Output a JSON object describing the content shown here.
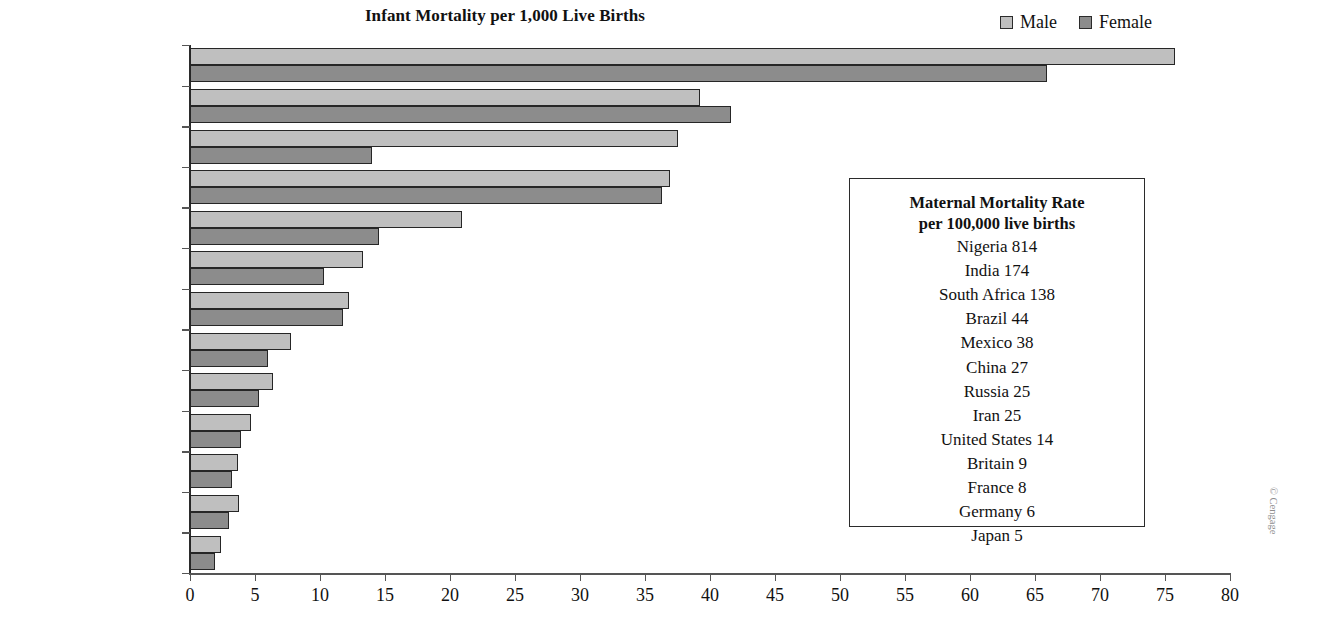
{
  "chart_data": {
    "type": "bar",
    "orientation": "horizontal",
    "title": "Infant Mortality per 1,000 Live Births",
    "xlabel": "",
    "ylabel": "",
    "xlim": [
      0,
      80
    ],
    "xticks": [
      0,
      5,
      10,
      15,
      20,
      25,
      30,
      35,
      40,
      45,
      50,
      55,
      60,
      65,
      70,
      75,
      80
    ],
    "grid": false,
    "legend_position": "top-right",
    "categories": [
      "Nigeria",
      "India",
      "Iran",
      "South Africa",
      "Brazil",
      "Mexico",
      "China",
      "Russia",
      "United States",
      "Britain",
      "Germany",
      "France",
      "Japan"
    ],
    "series": [
      {
        "name": "Male",
        "color": "#bfbfbf",
        "values": [
          75.8,
          39.2,
          37.5,
          36.9,
          20.9,
          13.3,
          12.2,
          7.8,
          6.4,
          4.7,
          3.7,
          3.8,
          2.4
        ]
      },
      {
        "name": "Female",
        "color": "#8c8c8c",
        "values": [
          65.9,
          41.6,
          14.0,
          36.3,
          14.5,
          10.3,
          11.8,
          6.0,
          5.3,
          3.9,
          3.2,
          3.0,
          1.9
        ]
      }
    ],
    "annotations": {
      "info_box_title_line1": "Maternal Mortality Rate",
      "info_box_title_line2": "per 100,000 live births",
      "info_box_rows": [
        "Nigeria 814",
        "India 174",
        "South Africa 138",
        "Brazil 44",
        "Mexico 38",
        "China 27",
        "Russia 25",
        "Iran 25",
        "United States 14",
        "Britain 9",
        "France 8",
        "Germany 6",
        "Japan 5"
      ]
    }
  },
  "credit": "© Cengage"
}
